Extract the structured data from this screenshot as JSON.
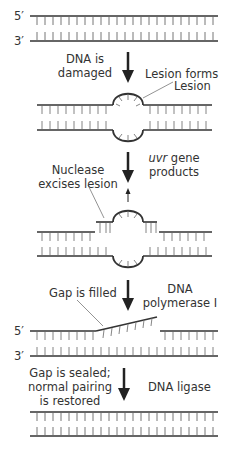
{
  "diagram": {
    "strand_labels": {
      "five_prime": "5′",
      "three_prime": "3′"
    },
    "steps": [
      {
        "left": [
          "DNA is",
          "damaged"
        ],
        "right": [
          "Lesion forms"
        ],
        "callout": "Lesion"
      },
      {
        "left": [
          "Nuclease",
          "excises lesion"
        ],
        "right_italic": "uvr",
        "right": [
          " gene",
          "products"
        ]
      },
      {
        "left": [
          "Gap is filled"
        ],
        "right": [
          "DNA",
          "polymerase I"
        ]
      },
      {
        "left": [
          "Gap is sealed;",
          "normal pairing",
          "is restored"
        ],
        "right": [
          "DNA ligase"
        ]
      }
    ],
    "colors": {
      "strand": "#333333",
      "rung": "#555555",
      "text": "#333333"
    }
  }
}
